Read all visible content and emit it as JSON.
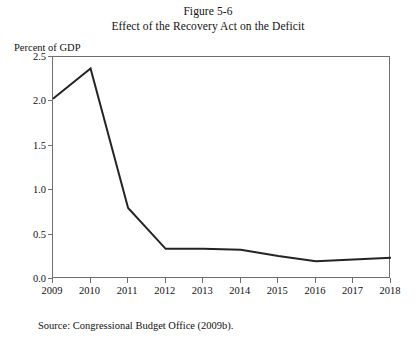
{
  "figure": {
    "number_line": "Figure 5-6",
    "title_line": "Effect of the Recovery Act on the Deficit",
    "source": "Source:  Congressional Budget Office (2009b)."
  },
  "axis": {
    "y_axis_label": "Percent of GDP",
    "y_ticks": [
      "0.0",
      "0.5",
      "1.0",
      "1.5",
      "2.0",
      "2.5"
    ],
    "x_ticks": [
      "2009",
      "2010",
      "2011",
      "2012",
      "2013",
      "2014",
      "2015",
      "2016",
      "2017",
      "2018"
    ]
  },
  "style": {
    "line_color": "#242424",
    "axis_color": "#6f6f72",
    "background": "#ffffff"
  },
  "chart_data": {
    "type": "line",
    "title": "Effect of the Recovery Act on the Deficit",
    "subtitle": "Figure 5-6",
    "xlabel": "",
    "ylabel": "Percent of GDP",
    "categories": [
      "2009",
      "2010",
      "2011",
      "2012",
      "2013",
      "2014",
      "2015",
      "2016",
      "2017",
      "2018"
    ],
    "x": [
      2009,
      2010,
      2011,
      2012,
      2013,
      2014,
      2015,
      2016,
      2017,
      2018
    ],
    "values": [
      2.03,
      2.37,
      0.8,
      0.34,
      0.34,
      0.33,
      0.26,
      0.2,
      0.22,
      0.24
    ],
    "series": [
      {
        "name": "Effect of the Recovery Act on the Deficit",
        "values": [
          2.03,
          2.37,
          0.8,
          0.34,
          0.34,
          0.33,
          0.26,
          0.2,
          0.22,
          0.24
        ]
      }
    ],
    "ylim": [
      0.0,
      2.5
    ],
    "xlim": [
      2009,
      2018
    ],
    "ytick_values": [
      0.0,
      0.5,
      1.0,
      1.5,
      2.0,
      2.5
    ],
    "grid": false,
    "legend": false,
    "source": "Source:  Congressional Budget Office (2009b)."
  }
}
